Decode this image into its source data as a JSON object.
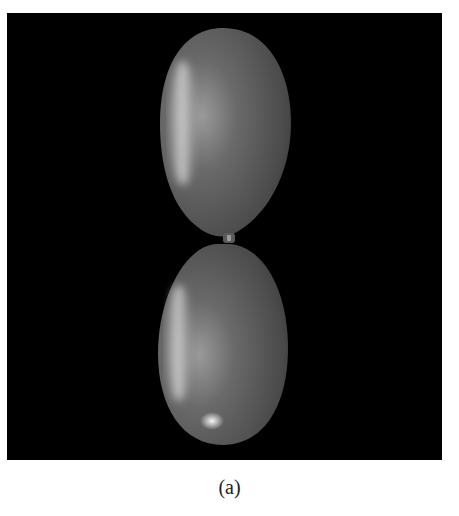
{
  "figure": {
    "caption": "(a)",
    "colors": {
      "background": "#000000",
      "balloon": "#6e6e6e",
      "highlight": "#d8d8d8"
    }
  }
}
